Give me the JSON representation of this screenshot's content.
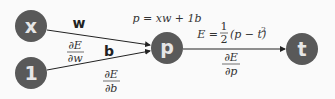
{
  "diagram": {
    "colors": {
      "node_fill": "#595959",
      "node_text": "#e6e6e6",
      "edge": "#222222",
      "background": "#fafafa"
    },
    "nodes": [
      {
        "id": "x",
        "label": "x"
      },
      {
        "id": "one",
        "label": "1"
      },
      {
        "id": "p",
        "label": "p"
      },
      {
        "id": "t",
        "label": "t"
      }
    ],
    "edges": [
      {
        "from": "x",
        "to": "p",
        "weight_label": "w",
        "grad_num": "∂E",
        "grad_den": "∂w"
      },
      {
        "from": "one",
        "to": "p",
        "weight_label": "b",
        "grad_num": "∂E",
        "grad_den": "∂b"
      },
      {
        "from": "p",
        "to": "t",
        "grad_num": "∂E",
        "grad_den": "∂p"
      }
    ],
    "equations": {
      "p_def": "p = xw + 1b",
      "loss_lhs": "E =",
      "loss_frac_num": "1",
      "loss_frac_den": "2",
      "loss_rhs": "(p − t)",
      "loss_exp": "2"
    }
  }
}
